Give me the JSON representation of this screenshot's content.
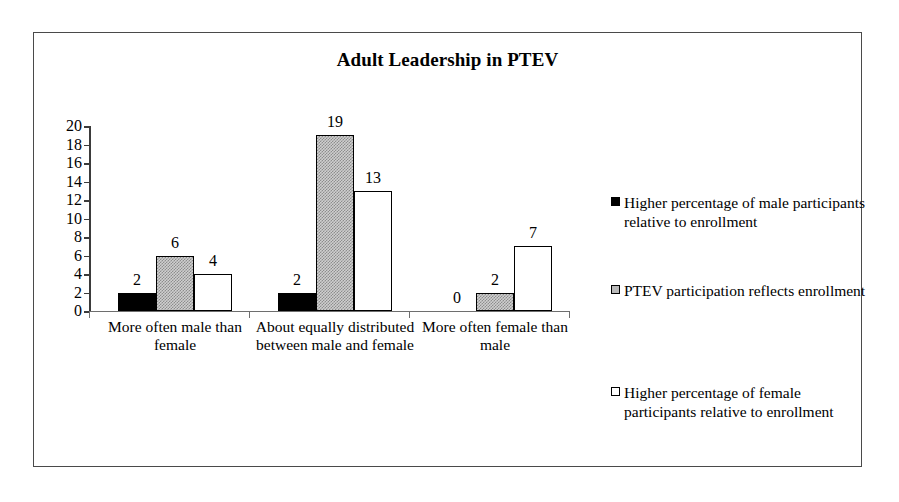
{
  "frame": {
    "border_color": "#4a4a4a"
  },
  "chart_data": {
    "type": "bar",
    "title": "Adult Leadership in PTEV",
    "xlabel": "",
    "ylabel": "",
    "ylim": [
      0,
      20
    ],
    "ytick_step": 2,
    "ytick_labels": [
      "20",
      "18",
      "16",
      "14",
      "12",
      "10",
      "8",
      "6",
      "4",
      "2",
      "0"
    ],
    "grid": false,
    "legend_position": "right",
    "categories": [
      "More often male than female",
      "About equally distributed between male and female",
      "More often female than male"
    ],
    "series": [
      {
        "name": "Higher percentage of male participants relative to enrollment",
        "color": "#000000",
        "fill": "solid-black",
        "values": [
          2,
          2,
          0
        ],
        "labels": [
          "2",
          "2",
          "0"
        ]
      },
      {
        "name": "PTEV participation reflects enrollment",
        "color": "#c0c0c0",
        "fill": "stippled-gray",
        "values": [
          6,
          19,
          2
        ],
        "labels": [
          "6",
          "19",
          "2"
        ]
      },
      {
        "name": "Higher percentage of female participants relative to enrollment",
        "color": "#ffffff",
        "fill": "white-outline",
        "values": [
          4,
          13,
          7
        ],
        "labels": [
          "4",
          "13",
          "7"
        ]
      }
    ]
  }
}
